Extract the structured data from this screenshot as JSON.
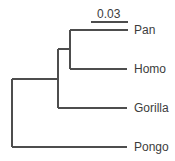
{
  "diagram": {
    "type": "phylogenetic-tree",
    "scale_bar": {
      "label": "0.03"
    },
    "taxa": [
      {
        "name": "Pan"
      },
      {
        "name": "Homo"
      },
      {
        "name": "Gorilla"
      },
      {
        "name": "Pongo"
      }
    ],
    "colors": {
      "line": "#4d4d4d",
      "text": "#3c3c3c",
      "background": "#ffffff"
    }
  }
}
